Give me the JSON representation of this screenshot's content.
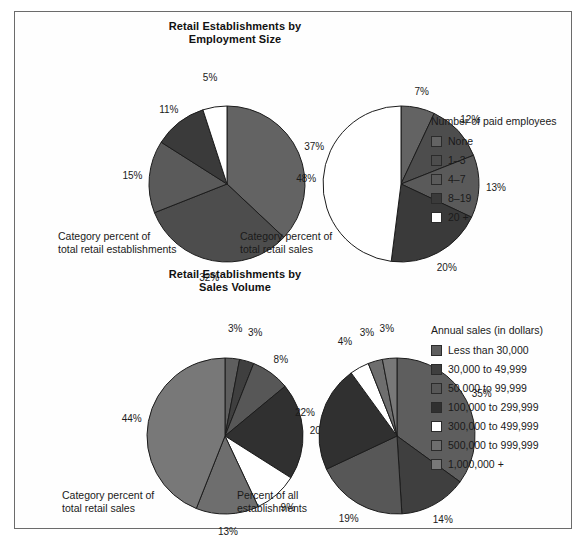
{
  "chart_data": [
    {
      "type": "pie",
      "id": "employment-establishments",
      "title": "Retail Establishments by\nEmployment Size",
      "caption": "Category percent of\ntotal retail establishments",
      "legend_title": "Number of paid employees",
      "categories": [
        "None",
        "1–3",
        "4–7",
        "8–19",
        "20 +"
      ],
      "values": [
        37,
        32,
        15,
        11,
        5
      ],
      "labels": [
        "37%",
        "32%",
        "15%",
        "11%",
        "5%"
      ],
      "colors": [
        "#636363",
        "#4d4d4d",
        "#5a5a5a",
        "#3a3a3a",
        "#ffffff"
      ],
      "start_angle": 0,
      "direction": "clockwise"
    },
    {
      "type": "pie",
      "id": "employment-sales",
      "title": "",
      "caption": "Category percent of\ntotal retail sales",
      "legend_title": "Number of paid employees",
      "categories": [
        "None",
        "1–3",
        "4–7",
        "8–19",
        "20 +"
      ],
      "values": [
        7,
        12,
        13,
        20,
        48
      ],
      "labels": [
        "7%",
        "12%",
        "13%",
        "20%",
        "48%"
      ],
      "colors": [
        "#636363",
        "#4d4d4d",
        "#5a5a5a",
        "#3a3a3a",
        "#ffffff"
      ],
      "start_angle": 0,
      "direction": "clockwise"
    },
    {
      "type": "pie",
      "id": "sales-volume-sales",
      "title": "Retail Establishments by\nSales Volume",
      "caption": "Category percent of\ntotal retail sales",
      "legend_title": "Annual sales (in dollars)",
      "categories": [
        "Less than 30,000",
        "30,000 to 49,999",
        "50,000 to 99,999",
        "100,000 to 299,999",
        "300,000 to 499,999",
        "500,000 to 999,999",
        "1,000,000 +"
      ],
      "values": [
        3,
        3,
        8,
        20,
        9,
        13,
        44
      ],
      "labels": [
        "3%",
        "3%",
        "8%",
        "20%",
        "9%",
        "13%",
        "44%"
      ],
      "colors": [
        "#5e5e5e",
        "#3f3f3f",
        "#575757",
        "#303030",
        "#ffffff",
        "#6e6e6e",
        "#787878"
      ],
      "start_angle": 0,
      "direction": "clockwise"
    },
    {
      "type": "pie",
      "id": "sales-volume-establishments",
      "title": "",
      "caption": "Percent of all\nestablishments",
      "legend_title": "Annual sales (in dollars)",
      "categories": [
        "Less than 30,000",
        "30,000 to 49,999",
        "50,000 to 99,999",
        "100,000 to 299,999",
        "300,000 to 499,999",
        "500,000 to 999,999",
        "1,000,000 +"
      ],
      "values": [
        35,
        14,
        19,
        22,
        4,
        3,
        3
      ],
      "labels": [
        "35%",
        "14%",
        "19%",
        "22%",
        "4%",
        "3%",
        "3%"
      ],
      "colors": [
        "#5e5e5e",
        "#3f3f3f",
        "#575757",
        "#303030",
        "#ffffff",
        "#6e6e6e",
        "#787878"
      ],
      "start_angle": 0,
      "direction": "clockwise"
    }
  ],
  "sections": [
    {
      "title": "Retail Establishments by\nEmployment Size",
      "legend": {
        "title": "Number of paid employees",
        "items": [
          {
            "label": "None",
            "color": "#636363"
          },
          {
            "label": "1–3",
            "color": "#4d4d4d"
          },
          {
            "label": "4–7",
            "color": "#5a5a5a"
          },
          {
            "label": "8–19",
            "color": "#3a3a3a"
          },
          {
            "label": "20 +",
            "color": "#ffffff"
          }
        ]
      },
      "pies": [
        {
          "caption": "Category percent of\ntotal retail establishments"
        },
        {
          "caption": "Category percent of\ntotal retail sales"
        }
      ]
    },
    {
      "title": "Retail Establishments by\nSales Volume",
      "legend": {
        "title": "Annual sales (in dollars)",
        "items": [
          {
            "label": "Less than 30,000",
            "color": "#5e5e5e"
          },
          {
            "label": "30,000 to 49,999",
            "color": "#3f3f3f"
          },
          {
            "label": "50,000 to 99,999",
            "color": "#575757"
          },
          {
            "label": "100,000 to 299,999",
            "color": "#303030"
          },
          {
            "label": "300,000 to 499,999",
            "color": "#ffffff"
          },
          {
            "label": "500,000 to 999,999",
            "color": "#6e6e6e"
          },
          {
            "label": "1,000,000 +",
            "color": "#787878"
          }
        ]
      },
      "pies": [
        {
          "caption": "Category percent of\ntotal retail sales"
        },
        {
          "caption": "Percent of all\nestablishments"
        }
      ]
    }
  ],
  "style": {
    "frame_border": "#6b6b6b",
    "slice_stroke": "#1c1c1c",
    "text_color": "#1a1a1a",
    "background": "#ffffff"
  }
}
